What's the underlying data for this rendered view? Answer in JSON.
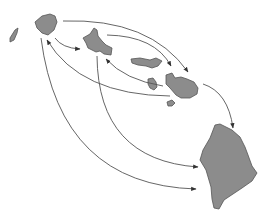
{
  "diagram": {
    "type": "island-dispersal-map",
    "colors": {
      "island_fill": "#8c8c8c",
      "island_stroke": "#555555",
      "arrow_stroke": "#555555",
      "background": "#ffffff"
    },
    "islands": [
      {
        "id": "niihau",
        "label": ""
      },
      {
        "id": "kauai",
        "label": ""
      },
      {
        "id": "oahu",
        "label": ""
      },
      {
        "id": "molokai",
        "label": ""
      },
      {
        "id": "lanai",
        "label": ""
      },
      {
        "id": "maui",
        "label": ""
      },
      {
        "id": "kahoolawe",
        "label": ""
      },
      {
        "id": "hawaii",
        "label": ""
      }
    ],
    "arrows": [
      {
        "from": "kauai",
        "to": "oahu"
      },
      {
        "from": "kauai",
        "to": "molokai"
      },
      {
        "from": "kauai",
        "to": "maui"
      },
      {
        "from": "kauai",
        "to": "hawaii"
      },
      {
        "from": "oahu",
        "to": "maui"
      },
      {
        "from": "oahu",
        "to": "hawaii"
      },
      {
        "from": "maui",
        "to": "kauai"
      },
      {
        "from": "maui",
        "to": "oahu"
      },
      {
        "from": "maui",
        "to": "hawaii"
      }
    ]
  }
}
